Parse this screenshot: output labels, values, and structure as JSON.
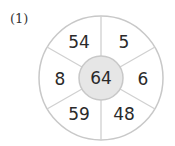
{
  "problem": {
    "label": "(1)",
    "center": "64",
    "segments": [
      "5",
      "6",
      "48",
      "59",
      "8",
      "54"
    ]
  },
  "colors": {
    "ring_stroke": "#c8c8c8",
    "center_fill": "#e6e6e6"
  }
}
